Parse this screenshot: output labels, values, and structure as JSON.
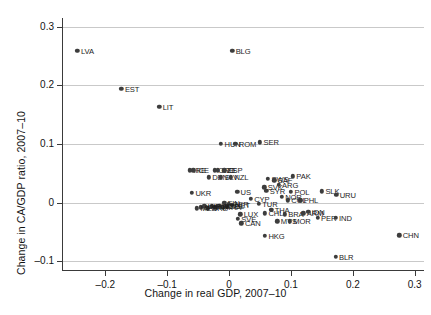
{
  "chart_data": {
    "type": "scatter",
    "title": "",
    "xlabel": "Change in real GDP, 2007–10",
    "ylabel": "Change in CA/GDP ratio, 2007–10",
    "xlim": [
      -0.27,
      0.315
    ],
    "ylim": [
      -0.115,
      0.315
    ],
    "xticks": [
      -0.2,
      -0.1,
      0,
      0.1,
      0.2,
      0.3
    ],
    "xtick_labels": [
      "–0.2",
      "–0.1",
      "0",
      "0.1",
      "0.2",
      "0.3"
    ],
    "yticks": [
      -0.1,
      0,
      0.1,
      0.2,
      0.3
    ],
    "ytick_labels": [
      "–0.1",
      "0",
      "0.1",
      "0.2",
      "0.3"
    ],
    "grid": "horizontal",
    "legend": "none",
    "marker_color": "#3d3d3d",
    "grid_color": "#c9c9c9",
    "axis_color": "#3a3a3a",
    "points": [
      {
        "label": "LVA",
        "x": -0.245,
        "y": 0.259
      },
      {
        "label": "BLG",
        "x": 0.005,
        "y": 0.259
      },
      {
        "label": "EST",
        "x": -0.174,
        "y": 0.194
      },
      {
        "label": "LIT",
        "x": -0.113,
        "y": 0.163
      },
      {
        "label": "HUN",
        "x": -0.013,
        "y": 0.1
      },
      {
        "label": "ROM",
        "x": 0.01,
        "y": 0.1
      },
      {
        "label": "SER",
        "x": 0.05,
        "y": 0.103
      },
      {
        "label": "IRE",
        "x": -0.063,
        "y": 0.055
      },
      {
        "label": "ICE",
        "x": -0.058,
        "y": 0.055
      },
      {
        "label": "CRO",
        "x": -0.023,
        "y": 0.055
      },
      {
        "label": "CZE",
        "x": -0.018,
        "y": 0.055
      },
      {
        "label": "ESP",
        "x": -0.008,
        "y": 0.055
      },
      {
        "label": "DEN",
        "x": -0.033,
        "y": 0.043
      },
      {
        "label": "SLV",
        "x": -0.013,
        "y": 0.043
      },
      {
        "label": "NZL",
        "x": 0.003,
        "y": 0.043
      },
      {
        "label": "SWS",
        "x": 0.063,
        "y": 0.041
      },
      {
        "label": "SAF",
        "x": 0.073,
        "y": 0.038
      },
      {
        "label": "PAK",
        "x": 0.103,
        "y": 0.045
      },
      {
        "label": "SVK",
        "x": 0.057,
        "y": 0.026
      },
      {
        "label": "ARG",
        "x": 0.08,
        "y": 0.03
      },
      {
        "label": "UKR",
        "x": -0.06,
        "y": 0.017
      },
      {
        "label": "US",
        "x": 0.013,
        "y": 0.018
      },
      {
        "label": "SYR",
        "x": 0.06,
        "y": 0.02
      },
      {
        "label": "POL",
        "x": 0.1,
        "y": 0.018
      },
      {
        "label": "SLK",
        "x": 0.15,
        "y": 0.019
      },
      {
        "label": "URU",
        "x": 0.173,
        "y": 0.013
      },
      {
        "label": "NOR",
        "x": 0.085,
        "y": 0.01
      },
      {
        "label": "COL",
        "x": 0.095,
        "y": 0.004
      },
      {
        "label": "PHL",
        "x": 0.115,
        "y": 0.004
      },
      {
        "label": "CYP",
        "x": 0.035,
        "y": 0.006
      },
      {
        "label": "TUR",
        "x": 0.048,
        "y": -0.002
      },
      {
        "label": "FIN",
        "x": -0.008,
        "y": 0.0
      },
      {
        "label": "GER",
        "x": 0.0,
        "y": -0.002
      },
      {
        "label": "NET",
        "x": 0.004,
        "y": -0.004
      },
      {
        "label": "BEL",
        "x": -0.004,
        "y": -0.006
      },
      {
        "label": "FRA",
        "x": -0.01,
        "y": -0.008
      },
      {
        "label": "AUT",
        "x": -0.016,
        "y": -0.006
      },
      {
        "label": "ITA",
        "x": -0.022,
        "y": -0.008
      },
      {
        "label": "POR",
        "x": -0.028,
        "y": -0.006
      },
      {
        "label": "GRE",
        "x": -0.034,
        "y": -0.01
      },
      {
        "label": "UK",
        "x": -0.04,
        "y": -0.006
      },
      {
        "label": "JPN",
        "x": -0.046,
        "y": -0.008
      },
      {
        "label": "MEX",
        "x": -0.052,
        "y": -0.01
      },
      {
        "label": "THA",
        "x": 0.068,
        "y": -0.012
      },
      {
        "label": "CHL",
        "x": 0.058,
        "y": -0.018
      },
      {
        "label": "BRA",
        "x": 0.09,
        "y": -0.02
      },
      {
        "label": "ARM",
        "x": 0.12,
        "y": -0.018
      },
      {
        "label": "IDN",
        "x": 0.128,
        "y": -0.016
      },
      {
        "label": "LUX",
        "x": 0.018,
        "y": -0.02
      },
      {
        "label": "SVE",
        "x": 0.014,
        "y": -0.028
      },
      {
        "label": "CAN",
        "x": 0.02,
        "y": -0.035
      },
      {
        "label": "MYS",
        "x": 0.078,
        "y": -0.032
      },
      {
        "label": "MOR",
        "x": 0.098,
        "y": -0.032
      },
      {
        "label": "PER",
        "x": 0.143,
        "y": -0.026
      },
      {
        "label": "IND",
        "x": 0.172,
        "y": -0.026
      },
      {
        "label": "HKG",
        "x": 0.058,
        "y": -0.057
      },
      {
        "label": "CHN",
        "x": 0.275,
        "y": -0.056
      },
      {
        "label": "BLR",
        "x": 0.172,
        "y": -0.092
      }
    ]
  }
}
